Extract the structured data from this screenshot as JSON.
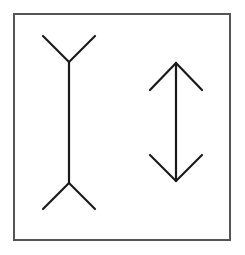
{
  "figure": {
    "title": "Müller-Lyer illusion",
    "background": "#ffffff",
    "frame": {
      "x": 14,
      "y": 14,
      "width": 216,
      "height": 226,
      "stroke": "#555555",
      "stroke_width": 2
    },
    "line_color": "#1a1a1a",
    "line_width": 2.2,
    "figures": [
      {
        "name": "fins-out-line",
        "shaft": {
          "x1": 69,
          "y1": 62,
          "x2": 69,
          "y2": 183
        },
        "fins": [
          {
            "x1": 69,
            "y1": 62,
            "x2": 43,
            "y2": 36
          },
          {
            "x1": 69,
            "y1": 62,
            "x2": 95,
            "y2": 36
          },
          {
            "x1": 69,
            "y1": 183,
            "x2": 43,
            "y2": 209
          },
          {
            "x1": 69,
            "y1": 183,
            "x2": 95,
            "y2": 209
          }
        ]
      },
      {
        "name": "arrowheads-in-line",
        "shaft": {
          "x1": 176,
          "y1": 63,
          "x2": 176,
          "y2": 181
        },
        "fins": [
          {
            "x1": 176,
            "y1": 63,
            "x2": 150,
            "y2": 90
          },
          {
            "x1": 176,
            "y1": 63,
            "x2": 202,
            "y2": 90
          },
          {
            "x1": 176,
            "y1": 181,
            "x2": 150,
            "y2": 155
          },
          {
            "x1": 176,
            "y1": 181,
            "x2": 202,
            "y2": 155
          }
        ]
      }
    ]
  }
}
